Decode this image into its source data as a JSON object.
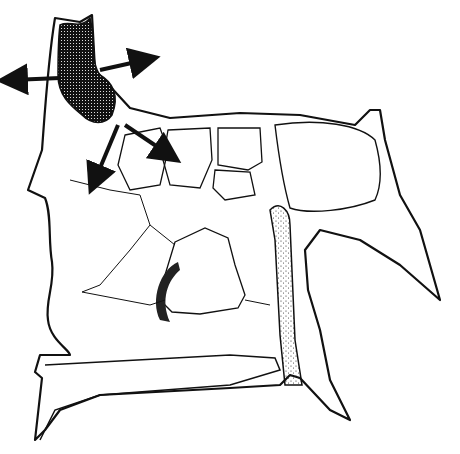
{
  "figure": {
    "title": "",
    "colors": {
      "line": "#111111",
      "background": "#ffffff",
      "shade": "#1a1a1a"
    },
    "labels": [],
    "arrow_count": 4
  }
}
